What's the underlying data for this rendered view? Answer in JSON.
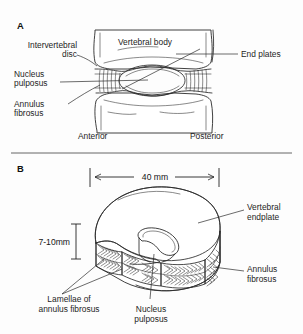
{
  "figure": {
    "background_color": "#fdfdfd",
    "ink_color": "#2b2b2b",
    "width_px": 303,
    "height_px": 334
  },
  "panel_a": {
    "letter": "A",
    "description": "Mid-sagittal section through two vertebral bodies and the intervening intervertebral disc",
    "labels": {
      "intervertebral_disc_line1": "Intervertebral",
      "intervertebral_disc_line2": "disc",
      "nucleus_pulposus_line1": "Nucleus",
      "nucleus_pulposus_line2": "pulposus",
      "annulus_fibrosus_line1": "Annulus",
      "annulus_fibrosus_line2": "fibrosus",
      "vertebral_body": "Vertebral body",
      "end_plates": "End plates",
      "anterior": "Anterior",
      "posterior": "Posterior"
    }
  },
  "panel_b": {
    "letter": "B",
    "description": "Three-dimensional cutaway view of an intervertebral disc showing lamellar structure",
    "labels": {
      "vertebral_endplate_line1": "Vertebral",
      "vertebral_endplate_line2": "endplate",
      "annulus_fibrosus_line1": "Annulus",
      "annulus_fibrosus_line2": "fibrosus",
      "lamellae_line1": "Lamellae of",
      "lamellae_line2": "annulus fibrosus",
      "nucleus_pulposus_line1": "Nucleus",
      "nucleus_pulposus_line2": "pulposus"
    },
    "dimensions": {
      "width": "40 mm",
      "height": "7-10mm"
    }
  }
}
